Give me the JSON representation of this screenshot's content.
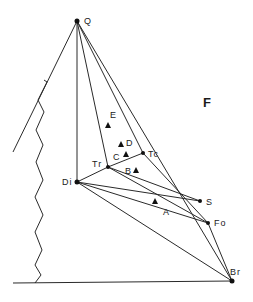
{
  "diagram": {
    "region_label": "F",
    "line_color": "#2a2a2a",
    "points": {
      "Q": {
        "label": "Q",
        "x": 77,
        "y": 21
      },
      "Di": {
        "label": "Di",
        "x": 77,
        "y": 182
      },
      "Tr": {
        "label": "Tr",
        "x": 108,
        "y": 167
      },
      "Tc": {
        "label": "Tc",
        "x": 143,
        "y": 153
      },
      "S": {
        "label": "S",
        "x": 200,
        "y": 201
      },
      "Fo": {
        "label": "Fo",
        "x": 208,
        "y": 223
      },
      "Br": {
        "label": "Br",
        "x": 232,
        "y": 281
      }
    },
    "samples": [
      {
        "label": "E",
        "x": 108,
        "y": 126
      },
      {
        "label": "D",
        "x": 120,
        "y": 145
      },
      {
        "label": "C",
        "x": 126,
        "y": 155
      },
      {
        "label": "B",
        "x": 135,
        "y": 171
      },
      {
        "label": "A",
        "x": 155,
        "y": 202
      }
    ]
  }
}
